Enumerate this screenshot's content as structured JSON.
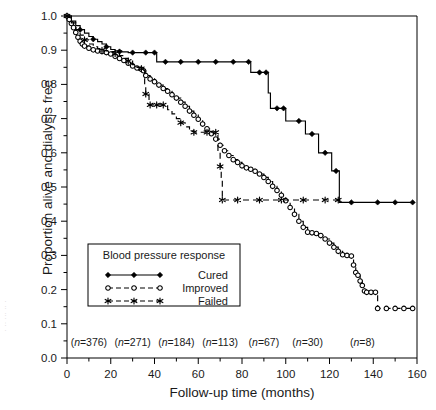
{
  "figure": {
    "x_axis_title": "Follow-up time (months)",
    "y_axis_title": "Proportion alive and dialysis free",
    "margin_artifact": "· ·· ··· ·· ·"
  },
  "legend": {
    "title": "Blood pressure response",
    "entries": [
      {
        "label": "Cured",
        "marker": "filled-diamond",
        "line": "solid"
      },
      {
        "label": "Improved",
        "marker": "open-circle",
        "line": "dashed"
      },
      {
        "label": "Failed",
        "marker": "star",
        "line": "dashed"
      }
    ]
  },
  "at_risk": {
    "prefix": "(n=",
    "suffix": ")",
    "italic_symbol": "n",
    "labels": [
      "(n=376)",
      "(n=271)",
      "(n=184)",
      "(n=113)",
      "(n=67)",
      "(n=30)",
      "(n=8)"
    ],
    "values": [
      376,
      271,
      184,
      113,
      67,
      30,
      8
    ],
    "x_positions": [
      10,
      30,
      50,
      70,
      90,
      110,
      135
    ]
  },
  "chart_data": {
    "type": "line",
    "subtype": "kaplan-meier-survival",
    "title": "",
    "xlabel": "Follow-up time (months)",
    "ylabel": "Proportion alive and dialysis free",
    "xlim": [
      0,
      160
    ],
    "ylim": [
      0.0,
      1.0
    ],
    "xticks": [
      0,
      20,
      40,
      60,
      80,
      100,
      120,
      140,
      160
    ],
    "xtick_labels": [
      "0",
      "20",
      "40",
      "60",
      "80",
      "100",
      "120",
      "140",
      "160"
    ],
    "x_minor_tick_step": 10,
    "yticks": [
      0.0,
      0.1,
      0.2,
      0.3,
      0.4,
      0.5,
      0.6,
      0.7,
      0.8,
      0.9,
      1.0
    ],
    "ytick_labels": [
      "0.0",
      "0.1",
      "0.2",
      "0.3",
      "0.4",
      "0.5",
      "0.6",
      "0.7",
      "0.8",
      "0.9",
      "1.0"
    ],
    "y_minor_tick_step": 0.05,
    "grid": false,
    "legend_position": "lower-left-inset",
    "series": [
      {
        "name": "Cured",
        "marker": "filled-diamond",
        "linestyle": "solid",
        "color": "#000000",
        "points": [
          [
            0,
            1.0
          ],
          [
            2,
            0.985
          ],
          [
            4,
            0.972
          ],
          [
            6,
            0.96
          ],
          [
            8,
            0.95
          ],
          [
            10,
            0.94
          ],
          [
            12,
            0.932
          ],
          [
            14,
            0.925
          ],
          [
            16,
            0.918
          ],
          [
            18,
            0.91
          ],
          [
            20,
            0.902
          ],
          [
            22,
            0.898
          ],
          [
            25,
            0.895
          ],
          [
            28,
            0.893
          ],
          [
            31,
            0.893
          ],
          [
            34,
            0.893
          ],
          [
            37,
            0.893
          ],
          [
            40,
            0.893
          ],
          [
            41,
            0.866
          ],
          [
            45,
            0.866
          ],
          [
            50,
            0.866
          ],
          [
            56,
            0.866
          ],
          [
            62,
            0.866
          ],
          [
            68,
            0.866
          ],
          [
            74,
            0.866
          ],
          [
            80,
            0.866
          ],
          [
            83,
            0.866
          ],
          [
            84,
            0.835
          ],
          [
            88,
            0.835
          ],
          [
            91,
            0.835
          ],
          [
            92,
            0.775
          ],
          [
            93,
            0.73
          ],
          [
            96,
            0.73
          ],
          [
            99,
            0.73
          ],
          [
            100,
            0.693
          ],
          [
            104,
            0.693
          ],
          [
            108,
            0.693
          ],
          [
            109,
            0.655
          ],
          [
            112,
            0.655
          ],
          [
            114,
            0.655
          ],
          [
            115,
            0.6
          ],
          [
            118,
            0.6
          ],
          [
            120,
            0.6
          ],
          [
            121,
            0.547
          ],
          [
            123,
            0.547
          ],
          [
            124,
            0.547
          ],
          [
            124.5,
            0.455
          ],
          [
            130,
            0.455
          ],
          [
            136,
            0.455
          ],
          [
            142,
            0.455
          ],
          [
            150,
            0.455
          ],
          [
            158,
            0.455
          ]
        ],
        "markers_at": [
          [
            0,
            1.0
          ],
          [
            6,
            0.96
          ],
          [
            12,
            0.932
          ],
          [
            18,
            0.91
          ],
          [
            24,
            0.896
          ],
          [
            30,
            0.893
          ],
          [
            36,
            0.893
          ],
          [
            40,
            0.893
          ],
          [
            45,
            0.866
          ],
          [
            52,
            0.866
          ],
          [
            60,
            0.866
          ],
          [
            68,
            0.866
          ],
          [
            76,
            0.866
          ],
          [
            83,
            0.866
          ],
          [
            88,
            0.835
          ],
          [
            91,
            0.835
          ],
          [
            96,
            0.73
          ],
          [
            99,
            0.73
          ],
          [
            106,
            0.693
          ],
          [
            112,
            0.655
          ],
          [
            118,
            0.6
          ],
          [
            123,
            0.547
          ],
          [
            130,
            0.455
          ],
          [
            142,
            0.455
          ],
          [
            150,
            0.455
          ],
          [
            158,
            0.455
          ]
        ],
        "final_value": 0.455,
        "start_value": 1.0
      },
      {
        "name": "Improved",
        "marker": "open-circle",
        "linestyle": "dashed",
        "color": "#000000",
        "points": [
          [
            0,
            1.0
          ],
          [
            1,
            0.99
          ],
          [
            2,
            0.978
          ],
          [
            3,
            0.966
          ],
          [
            4,
            0.952
          ],
          [
            5,
            0.938
          ],
          [
            6,
            0.926
          ],
          [
            7,
            0.918
          ],
          [
            8,
            0.912
          ],
          [
            10,
            0.906
          ],
          [
            12,
            0.901
          ],
          [
            14,
            0.898
          ],
          [
            16,
            0.896
          ],
          [
            18,
            0.893
          ],
          [
            20,
            0.889
          ],
          [
            22,
            0.882
          ],
          [
            24,
            0.876
          ],
          [
            26,
            0.87
          ],
          [
            28,
            0.862
          ],
          [
            30,
            0.854
          ],
          [
            32,
            0.848
          ],
          [
            34,
            0.844
          ],
          [
            35,
            0.84
          ],
          [
            36,
            0.826
          ],
          [
            38,
            0.816
          ],
          [
            40,
            0.808
          ],
          [
            42,
            0.798
          ],
          [
            44,
            0.788
          ],
          [
            46,
            0.78
          ],
          [
            48,
            0.77
          ],
          [
            50,
            0.76
          ],
          [
            52,
            0.748
          ],
          [
            54,
            0.736
          ],
          [
            56,
            0.722
          ],
          [
            58,
            0.71
          ],
          [
            60,
            0.698
          ],
          [
            62,
            0.684
          ],
          [
            64,
            0.67
          ],
          [
            66,
            0.656
          ],
          [
            68,
            0.64
          ],
          [
            70,
            0.622
          ],
          [
            72,
            0.606
          ],
          [
            74,
            0.592
          ],
          [
            76,
            0.58
          ],
          [
            78,
            0.572
          ],
          [
            80,
            0.562
          ],
          [
            82,
            0.556
          ],
          [
            84,
            0.552
          ],
          [
            86,
            0.546
          ],
          [
            88,
            0.538
          ],
          [
            90,
            0.528
          ],
          [
            92,
            0.516
          ],
          [
            94,
            0.502
          ],
          [
            96,
            0.49
          ],
          [
            98,
            0.476
          ],
          [
            100,
            0.46
          ],
          [
            102,
            0.44
          ],
          [
            104,
            0.42
          ],
          [
            106,
            0.4
          ],
          [
            108,
            0.382
          ],
          [
            110,
            0.368
          ],
          [
            112,
            0.366
          ],
          [
            114,
            0.364
          ],
          [
            116,
            0.358
          ],
          [
            118,
            0.348
          ],
          [
            120,
            0.336
          ],
          [
            122,
            0.324
          ],
          [
            124,
            0.312
          ],
          [
            126,
            0.302
          ],
          [
            128,
            0.3
          ],
          [
            130,
            0.298
          ],
          [
            131,
            0.272
          ],
          [
            132,
            0.25
          ],
          [
            133,
            0.242
          ],
          [
            134,
            0.225
          ],
          [
            135,
            0.212
          ],
          [
            136,
            0.196
          ],
          [
            137,
            0.192
          ],
          [
            139,
            0.192
          ],
          [
            141,
            0.192
          ],
          [
            142,
            0.145
          ],
          [
            146,
            0.145
          ],
          [
            150,
            0.145
          ],
          [
            154,
            0.145
          ],
          [
            158,
            0.145
          ]
        ],
        "final_value": 0.145,
        "start_value": 1.0
      },
      {
        "name": "Failed",
        "marker": "star",
        "linestyle": "dashed",
        "color": "#000000",
        "points": [
          [
            0,
            1.0
          ],
          [
            2,
            0.98
          ],
          [
            4,
            0.96
          ],
          [
            6,
            0.944
          ],
          [
            8,
            0.93
          ],
          [
            10,
            0.918
          ],
          [
            12,
            0.91
          ],
          [
            14,
            0.904
          ],
          [
            16,
            0.9
          ],
          [
            18,
            0.898
          ],
          [
            20,
            0.896
          ],
          [
            22,
            0.89
          ],
          [
            24,
            0.884
          ],
          [
            26,
            0.876
          ],
          [
            28,
            0.868
          ],
          [
            30,
            0.858
          ],
          [
            32,
            0.85
          ],
          [
            34,
            0.846
          ],
          [
            35,
            0.842
          ],
          [
            35.5,
            0.8
          ],
          [
            36,
            0.772
          ],
          [
            37,
            0.772
          ],
          [
            37.5,
            0.74
          ],
          [
            40,
            0.74
          ],
          [
            43,
            0.74
          ],
          [
            44,
            0.74
          ],
          [
            46,
            0.726
          ],
          [
            48,
            0.714
          ],
          [
            50,
            0.7
          ],
          [
            52,
            0.688
          ],
          [
            54,
            0.676
          ],
          [
            56,
            0.664
          ],
          [
            58,
            0.66
          ],
          [
            60,
            0.66
          ],
          [
            62,
            0.66
          ],
          [
            64,
            0.66
          ],
          [
            66,
            0.66
          ],
          [
            68,
            0.66
          ],
          [
            69,
            0.6
          ],
          [
            70,
            0.56
          ],
          [
            70.5,
            0.528
          ],
          [
            71,
            0.462
          ],
          [
            78,
            0.462
          ],
          [
            86,
            0.462
          ],
          [
            94,
            0.462
          ],
          [
            102,
            0.462
          ],
          [
            110,
            0.462
          ],
          [
            118,
            0.462
          ],
          [
            124,
            0.462
          ]
        ],
        "markers_at": [
          [
            0,
            1.0
          ],
          [
            8,
            0.93
          ],
          [
            16,
            0.9
          ],
          [
            22,
            0.89
          ],
          [
            28,
            0.868
          ],
          [
            34,
            0.846
          ],
          [
            36,
            0.772
          ],
          [
            38,
            0.74
          ],
          [
            41,
            0.74
          ],
          [
            44,
            0.74
          ],
          [
            52,
            0.688
          ],
          [
            58,
            0.66
          ],
          [
            64,
            0.66
          ],
          [
            68,
            0.66
          ],
          [
            70,
            0.56
          ],
          [
            71,
            0.462
          ],
          [
            78,
            0.462
          ],
          [
            88,
            0.462
          ],
          [
            98,
            0.462
          ],
          [
            108,
            0.462
          ],
          [
            118,
            0.462
          ],
          [
            124,
            0.462
          ]
        ],
        "final_value": 0.462,
        "plateau_start_x": 71,
        "start_value": 1.0
      }
    ]
  }
}
